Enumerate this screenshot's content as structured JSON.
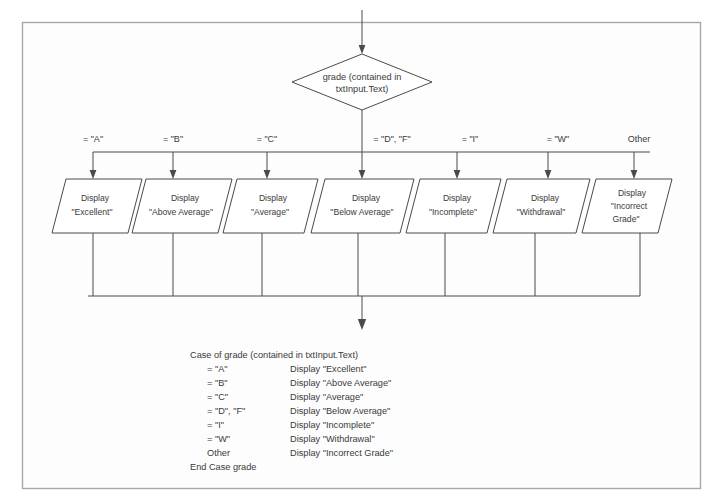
{
  "figure": {
    "caption": ""
  },
  "decision": {
    "line1": "grade (contained in",
    "line2": "txtInput.Text)"
  },
  "branches": [
    {
      "label": "= \"A\"",
      "box_line1": "Display",
      "box_line2": "\"Excellent\"",
      "box_line3": ""
    },
    {
      "label": "= \"B\"",
      "box_line1": "Display",
      "box_line2": "\"Above Average\"",
      "box_line3": ""
    },
    {
      "label": "= \"C\"",
      "box_line1": "Display",
      "box_line2": "\"Average\"",
      "box_line3": ""
    },
    {
      "label": "= \"D\", \"F\"",
      "box_line1": "Display",
      "box_line2": "\"Below Average\"",
      "box_line3": ""
    },
    {
      "label": "= \"I\"",
      "box_line1": "Display",
      "box_line2": "\"Incomplete\"",
      "box_line3": ""
    },
    {
      "label": "= \"W\"",
      "box_line1": "Display",
      "box_line2": "\"Withdrawal\"",
      "box_line3": ""
    },
    {
      "label": "Other",
      "box_line1": "Display",
      "box_line2": "\"Incorrect",
      "box_line3": "Grade\""
    }
  ],
  "pseudocode": {
    "header": "Case of grade (contained in txtInput.Text)",
    "rows": [
      {
        "condition": "= \"A\"",
        "action": "Display \"Excellent\""
      },
      {
        "condition": "= \"B\"",
        "action": "Display \"Above Average\""
      },
      {
        "condition": "= \"C\"",
        "action": "Display \"Average\""
      },
      {
        "condition": "= \"D\", \"F\"",
        "action": "Display \"Below Average\""
      },
      {
        "condition": "= \"I\"",
        "action": "Display \"Incomplete\""
      },
      {
        "condition": "= \"W\"",
        "action": "Display \"Withdrawal\""
      },
      {
        "condition": "Other",
        "action": "Display \"Incorrect Grade\""
      }
    ],
    "footer": "End Case grade"
  },
  "colors": {
    "stroke": "#4a4a4a",
    "frame": "#a8a8a8",
    "text": "#3a3a3a",
    "background": "#fdfdfd"
  }
}
